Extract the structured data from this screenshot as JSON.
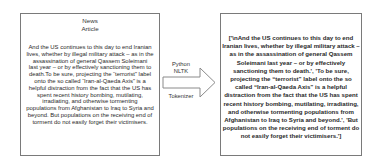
{
  "input_box": {
    "title_line_1": "News",
    "title_line_2": "Article",
    "body_lines": [
      "And the US continues to this day to end Iranian",
      "lives, whether by illegal military attack – as in the",
      "assassination of general Qassem Soleimani",
      "last year – or by effectively sanctioning them to",
      "death.To be sure, projecting the “terrorist” label",
      "onto the so called “Iran-al-Qaeda Axis” is a",
      "helpful distraction from the fact that the US has",
      "spent recent history bombing, mutilating,",
      "irradiating, and otherwise tormenting",
      "populations from Afghanistan to Iraq to Syria and",
      "beyond. But populations on the receiving end of",
      "torment do not easily forget their victimisers."
    ]
  },
  "arrow": {
    "label_line_1": "Python",
    "label_line_2": "NLTK",
    "label_bottom": "Tokenizer",
    "stroke_color": "#8a8a8a"
  },
  "output_box": {
    "body_lines": [
      "['\\nAnd the US continues to this day to end",
      "Iranian lives, whether by illegal military attack –",
      "as in the assassination of general Qassem",
      "Soleimani last year – or by effectively",
      "sanctioning them to death.', 'To be sure,",
      "projecting the “terrorist” label onto the so",
      "called “Iran-al-Qaeda Axis” is a helpful",
      "distraction from the fact that the US has spent",
      "recent history bombing, mutilating, irradiating,",
      "and otherwise tormenting populations from",
      "Afghanistan to Iraq to Syria and beyond.', 'But",
      "populations on the receiving end of torment do",
      "not easily forget their victimisers.']"
    ]
  }
}
